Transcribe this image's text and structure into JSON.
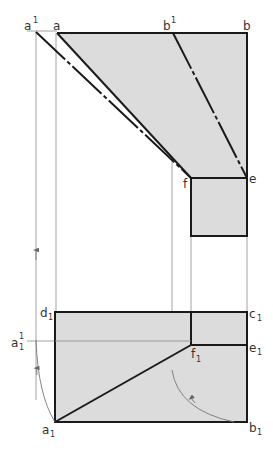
{
  "diagram": {
    "type": "orthographic-projection-true-length",
    "colors": {
      "fill": "#dcdcdc",
      "outline": "#1a1a1a",
      "construction": "#888888",
      "label": "#333333"
    },
    "top_view_labels": {
      "a1_sup": {
        "base": "a",
        "sup": "1"
      },
      "a": {
        "base": "a"
      },
      "b1_sup": {
        "base": "b",
        "sup": "1"
      },
      "b": {
        "base": "b"
      },
      "f": {
        "base": "f"
      },
      "e": {
        "base": "e"
      }
    },
    "bottom_view_labels": {
      "d1": {
        "base": "d",
        "sub": "1"
      },
      "c1": {
        "base": "c",
        "sub": "1"
      },
      "a1_1": {
        "base": "a",
        "sub": "1",
        "sup": "1"
      },
      "f1": {
        "base": "f",
        "sub": "1"
      },
      "e1": {
        "base": "e",
        "sub": "1"
      },
      "a1": {
        "base": "a",
        "sub": "1"
      },
      "b1": {
        "base": "b",
        "sub": "1"
      }
    }
  }
}
